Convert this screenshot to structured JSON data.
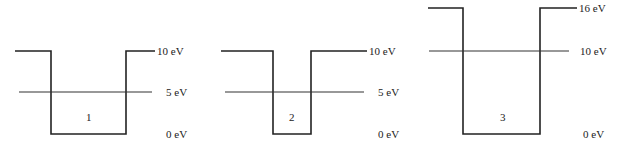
{
  "wells": [
    {
      "id": "1",
      "label": "1",
      "barrier_label": "10 eV",
      "level_label": "5 eV",
      "bottom_label": "0 eV",
      "barrier_eV": 10,
      "level_eV": 5,
      "bottom_eV": 0,
      "width_relative": "wide"
    },
    {
      "id": "2",
      "label": "2",
      "barrier_label": "10 eV",
      "level_label": "5 eV",
      "bottom_label": "0 eV",
      "barrier_eV": 10,
      "level_eV": 5,
      "bottom_eV": 0,
      "width_relative": "narrow"
    },
    {
      "id": "3",
      "label": "3",
      "barrier_label": "16 eV",
      "level_label": "10 eV",
      "bottom_label": "0 eV",
      "barrier_eV": 16,
      "level_eV": 10,
      "bottom_eV": 0,
      "width_relative": "wide"
    }
  ]
}
